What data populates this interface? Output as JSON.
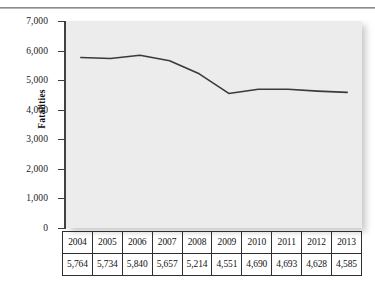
{
  "chart_data": {
    "type": "line",
    "title": "",
    "xlabel": "",
    "ylabel": "Fatalities",
    "ylim": [
      0,
      7000
    ],
    "ytick_labels": [
      "7,000",
      "6,000",
      "5,000",
      "4,000",
      "3,000",
      "2,000",
      "1,000",
      "0"
    ],
    "ytick_values": [
      7000,
      6000,
      5000,
      4000,
      3000,
      2000,
      1000,
      0
    ],
    "grid": false,
    "legend": "none",
    "categories": [
      "2004",
      "2005",
      "2006",
      "2007",
      "2008",
      "2009",
      "2010",
      "2011",
      "2012",
      "2013"
    ],
    "values": [
      5764,
      5734,
      5840,
      5657,
      5214,
      4551,
      4690,
      4693,
      4628,
      4585
    ],
    "value_labels": [
      "5,764",
      "5,734",
      "5,840",
      "5,657",
      "5,214",
      "4,551",
      "4,690",
      "4,693",
      "4,628",
      "4,585"
    ],
    "series": [
      {
        "name": "Fatalities",
        "values": [
          5764,
          5734,
          5840,
          5657,
          5214,
          4551,
          4690,
          4693,
          4628,
          4585
        ],
        "color": "#3a3a3a"
      }
    ],
    "plot_background": "#ececec",
    "line_color": "#3a3a3a",
    "axis_color": "#3c3c3c"
  },
  "axis": {
    "y_title": "Fatalities"
  },
  "table": {
    "years_row": [
      "2004",
      "2005",
      "2006",
      "2007",
      "2008",
      "2009",
      "2010",
      "2011",
      "2012",
      "2013"
    ],
    "values_row": [
      "5,764",
      "5,734",
      "5,840",
      "5,657",
      "5,214",
      "4,551",
      "4,690",
      "4,693",
      "4,628",
      "4,585"
    ]
  }
}
